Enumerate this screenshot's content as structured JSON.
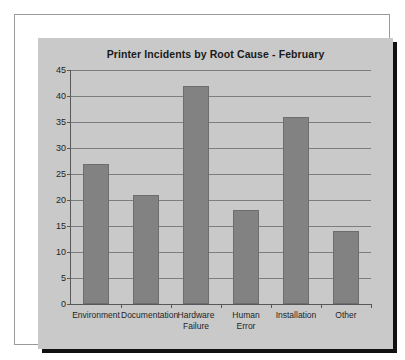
{
  "chart_data": {
    "type": "bar",
    "title": "Printer Incidents by Root Cause - February",
    "xlabel": "",
    "ylabel": "",
    "categories": [
      "Environment",
      "Documentation",
      "Hardware\nFailure",
      "Human\nError",
      "Installation",
      "Other"
    ],
    "values": [
      27,
      21,
      42,
      18,
      36,
      14
    ],
    "ylim": [
      0,
      45
    ],
    "ytick_values": [
      0,
      5,
      10,
      15,
      20,
      25,
      30,
      35,
      40,
      45
    ],
    "ytick_labels": [
      "0",
      "5",
      "10",
      "15",
      "20",
      "25",
      "30",
      "35",
      "40",
      "45"
    ],
    "grid": true,
    "legend": false,
    "bar_color": "#828282",
    "plot_background": "#c9c9c9",
    "gridline_color": "#7d7d7d",
    "axis_color": "#585858",
    "title_color": "#1a1a1a"
  }
}
